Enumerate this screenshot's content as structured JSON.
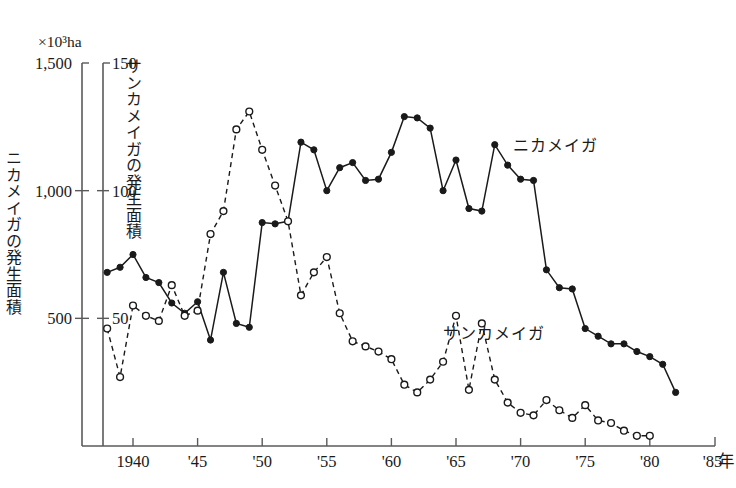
{
  "figure": {
    "unit_label": "×10³ha",
    "left_axis_title": "ニカメイガの発生面積",
    "right_axis_title": "サンカメイガの発生面積",
    "x_axis_unit": "年"
  },
  "annotations": {
    "solid_series_label": "ニカメイガ",
    "dashed_series_label": "サンカメイガ"
  },
  "axes": {
    "left_ticks": [
      {
        "value": 1500,
        "label": "1,500"
      },
      {
        "value": 1000,
        "label": "1,000"
      },
      {
        "value": 500,
        "label": "500"
      }
    ],
    "right_ticks": [
      {
        "value": 150,
        "label": "150"
      },
      {
        "value": 100,
        "label": "100"
      },
      {
        "value": 50,
        "label": "50"
      }
    ],
    "x_ticks": [
      {
        "value": 1940,
        "label": "1940"
      },
      {
        "value": 1945,
        "label": "'45"
      },
      {
        "value": 1950,
        "label": "'50"
      },
      {
        "value": 1955,
        "label": "'55"
      },
      {
        "value": 1960,
        "label": "'60"
      },
      {
        "value": 1965,
        "label": "'65"
      },
      {
        "value": 1970,
        "label": "'70"
      },
      {
        "value": 1975,
        "label": "'75"
      },
      {
        "value": 1980,
        "label": "'80"
      },
      {
        "value": 1985,
        "label": "'85"
      }
    ]
  },
  "chart_data": {
    "type": "line",
    "title": "",
    "xlabel": "年",
    "ylabel": "ニカメイガの発生面積 (×10³ha)",
    "ylabel_secondary": "サンカメイガの発生面積 (×10³ha)",
    "xlim": [
      1937,
      1985
    ],
    "ylim": [
      0,
      1500
    ],
    "ylim_secondary": [
      0,
      150
    ],
    "grid": false,
    "legend_position": "inline-annotation",
    "series": [
      {
        "name": "ニカメイガ",
        "axis": "left",
        "line_style": "solid",
        "marker": "filled-circle",
        "x": [
          1938,
          1939,
          1940,
          1941,
          1942,
          1943,
          1944,
          1945,
          1946,
          1947,
          1948,
          1949,
          1950,
          1951,
          1952,
          1953,
          1954,
          1955,
          1956,
          1957,
          1958,
          1959,
          1960,
          1961,
          1962,
          1963,
          1964,
          1965,
          1966,
          1967,
          1968,
          1969,
          1970,
          1971,
          1972,
          1973,
          1974,
          1975,
          1976,
          1977,
          1978,
          1979,
          1980,
          1981,
          1982
        ],
        "y": [
          680,
          700,
          750,
          660,
          640,
          560,
          520,
          565,
          415,
          680,
          480,
          465,
          875,
          870,
          880,
          1190,
          1160,
          1000,
          1090,
          1110,
          1040,
          1045,
          1150,
          1290,
          1285,
          1245,
          1000,
          1120,
          930,
          920,
          1180,
          1100,
          1045,
          1040,
          690,
          620,
          615,
          460,
          430,
          400,
          400,
          370,
          350,
          320,
          210
        ]
      },
      {
        "name": "サンカメイガ",
        "axis": "right",
        "line_style": "dashed",
        "marker": "open-circle",
        "x": [
          1938,
          1939,
          1940,
          1941,
          1942,
          1943,
          1944,
          1945,
          1946,
          1947,
          1948,
          1949,
          1950,
          1951,
          1952,
          1953,
          1954,
          1955,
          1956,
          1957,
          1958,
          1959,
          1960,
          1961,
          1962,
          1963,
          1964,
          1965,
          1966,
          1967,
          1968,
          1969,
          1970,
          1971,
          1972,
          1973,
          1974,
          1975,
          1976,
          1977,
          1978,
          1979,
          1980
        ],
        "y": [
          46,
          27,
          55,
          51,
          49,
          63,
          51,
          53,
          83,
          92,
          124,
          131,
          116,
          102,
          88,
          59,
          68,
          74,
          52,
          41,
          39,
          37,
          34,
          24,
          21,
          26,
          33,
          51,
          22,
          48,
          26,
          17,
          13,
          12,
          18,
          14,
          11,
          16,
          10,
          9,
          6,
          4,
          4
        ]
      }
    ]
  }
}
